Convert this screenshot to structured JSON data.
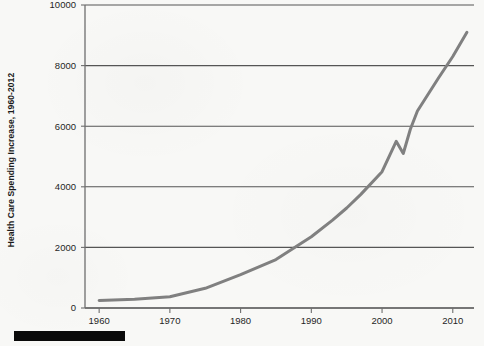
{
  "figure": {
    "background_color": "#f8f8f6",
    "line_color": "#808080",
    "gridline_color": "#555555",
    "axis_color": "#6e6e6e",
    "text_color": "#1f1f1f",
    "redaction_bar_color": "#0a0a0a",
    "redaction_bar_label": "redacted-caption-bar"
  },
  "chart_data": {
    "type": "line",
    "title": "",
    "subtitle": "",
    "xlabel": "",
    "ylabel": "Health Care Spending Increase, 1960-2012",
    "xlim": [
      1958,
      2013
    ],
    "ylim": [
      0,
      10000
    ],
    "grid": true,
    "grid_axis": "y",
    "legend": false,
    "legend_position": "none",
    "ytick_labels": [
      "10000",
      "8000",
      "6000",
      "4000",
      "2000",
      "0"
    ],
    "ytick_values": [
      10000,
      8000,
      6000,
      4000,
      2000,
      0
    ],
    "xtick_labels": [
      "1960",
      "1970",
      "1980",
      "1990",
      "2000",
      "2010"
    ],
    "xtick_values": [
      1960,
      1970,
      1980,
      1990,
      2000,
      2010
    ],
    "series": [
      {
        "name": "Health Care Spending Increase",
        "color": "#808080",
        "line_width": 3,
        "x": [
          1960,
          1965,
          1970,
          1975,
          1980,
          1985,
          1990,
          1993,
          1995,
          1997,
          2000,
          2002,
          2003,
          2004,
          2005,
          2008,
          2010,
          2012
        ],
        "values": [
          250,
          290,
          370,
          650,
          1100,
          1600,
          2350,
          2900,
          3300,
          3750,
          4500,
          5500,
          5100,
          5900,
          6500,
          7600,
          8300,
          9100
        ]
      }
    ]
  }
}
